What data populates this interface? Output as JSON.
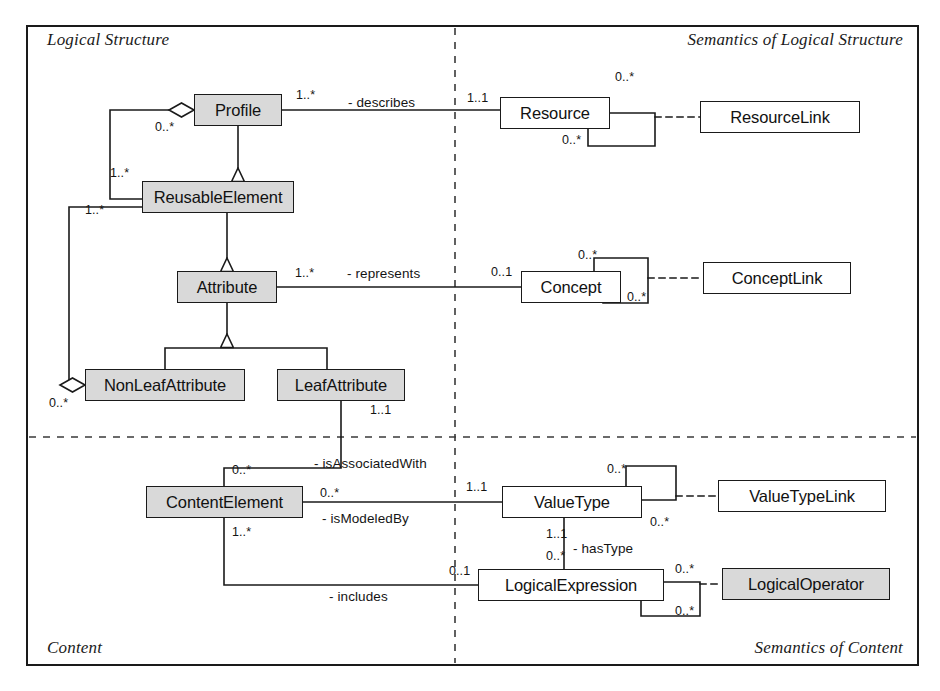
{
  "diagram": {
    "colors": {
      "shaded_fill": "#d9d9d9",
      "plain_fill": "#ffffff",
      "line": "#1a1a1a",
      "background": "#ffffff"
    },
    "quadrant_labels": [
      {
        "id": "logical-structure",
        "text": "Logical Structure",
        "x": 47,
        "y": 30,
        "align": "left"
      },
      {
        "id": "semantics-logical-structure",
        "text": "Semantics of Logical Structure",
        "x": 903,
        "y": 30,
        "align": "right"
      },
      {
        "id": "content",
        "text": "Content",
        "x": 47,
        "y": 638,
        "align": "left"
      },
      {
        "id": "semantics-of-content",
        "text": "Semantics of Content",
        "x": 903,
        "y": 638,
        "align": "right"
      }
    ],
    "classes": [
      {
        "id": "profile",
        "name": "Profile",
        "shaded": true,
        "x": 194,
        "y": 94,
        "w": 88,
        "h": 32
      },
      {
        "id": "reusable-element",
        "name": "ReusableElement",
        "shaded": true,
        "x": 142,
        "y": 181,
        "w": 152,
        "h": 32
      },
      {
        "id": "attribute",
        "name": "Attribute",
        "shaded": true,
        "x": 177,
        "y": 271,
        "w": 100,
        "h": 32
      },
      {
        "id": "non-leaf-attribute",
        "name": "NonLeafAttribute",
        "shaded": true,
        "x": 85,
        "y": 369,
        "w": 160,
        "h": 32
      },
      {
        "id": "leaf-attribute",
        "name": "LeafAttribute",
        "shaded": true,
        "x": 277,
        "y": 369,
        "w": 128,
        "h": 32
      },
      {
        "id": "content-element",
        "name": "ContentElement",
        "shaded": true,
        "x": 146,
        "y": 486,
        "w": 157,
        "h": 32
      },
      {
        "id": "resource",
        "name": "Resource",
        "shaded": false,
        "x": 500,
        "y": 97,
        "w": 110,
        "h": 32
      },
      {
        "id": "resource-link",
        "name": "ResourceLink",
        "shaded": false,
        "x": 700,
        "y": 101,
        "w": 160,
        "h": 32
      },
      {
        "id": "concept",
        "name": "Concept",
        "shaded": false,
        "x": 521,
        "y": 271,
        "w": 100,
        "h": 32
      },
      {
        "id": "concept-link",
        "name": "ConceptLink",
        "shaded": false,
        "x": 703,
        "y": 262,
        "w": 148,
        "h": 32
      },
      {
        "id": "value-type",
        "name": "ValueType",
        "shaded": false,
        "x": 502,
        "y": 486,
        "w": 140,
        "h": 32
      },
      {
        "id": "value-type-link",
        "name": "ValueTypeLink",
        "shaded": false,
        "x": 718,
        "y": 480,
        "w": 168,
        "h": 32
      },
      {
        "id": "logical-expression",
        "name": "LogicalExpression",
        "shaded": false,
        "x": 478,
        "y": 569,
        "w": 186,
        "h": 32
      },
      {
        "id": "logical-operator",
        "name": "LogicalOperator",
        "shaded": true,
        "x": 722,
        "y": 568,
        "w": 168,
        "h": 32
      }
    ],
    "multiplicities": [
      {
        "id": "profile-describes-source",
        "text": "1..*",
        "x": 296,
        "y": 88
      },
      {
        "id": "profile-aggregation-end",
        "text": "0..*",
        "x": 155,
        "y": 120
      },
      {
        "id": "profile-to-reusable-target",
        "text": "1..*",
        "x": 110,
        "y": 166
      },
      {
        "id": "nonleaf-aggregation-target",
        "text": "1..*",
        "x": 85,
        "y": 203
      },
      {
        "id": "attribute-represents-source",
        "text": "1..*",
        "x": 295,
        "y": 266
      },
      {
        "id": "nonleaf-aggregation-end",
        "text": "0..*",
        "x": 49,
        "y": 396
      },
      {
        "id": "leafattribute-assoc-source",
        "text": "1..1",
        "x": 370,
        "y": 403
      },
      {
        "id": "contentelement-associatedwith",
        "text": "0..*",
        "x": 232,
        "y": 463
      },
      {
        "id": "contentelement-modeledby",
        "text": "0..*",
        "x": 320,
        "y": 486
      },
      {
        "id": "contentelement-includes",
        "text": "1..*",
        "x": 232,
        "y": 525
      },
      {
        "id": "resource-describes-target",
        "text": "1..1",
        "x": 467,
        "y": 91
      },
      {
        "id": "resource-self-top",
        "text": "0..*",
        "x": 615,
        "y": 70
      },
      {
        "id": "resource-self-bottom",
        "text": "0..*",
        "x": 562,
        "y": 133
      },
      {
        "id": "concept-represents-target",
        "text": "0..1",
        "x": 491,
        "y": 265
      },
      {
        "id": "concept-self-top",
        "text": "0..*",
        "x": 578,
        "y": 248
      },
      {
        "id": "concept-self-bottom",
        "text": "0..*",
        "x": 627,
        "y": 290
      },
      {
        "id": "valuetype-modeledby-target",
        "text": "1..1",
        "x": 466,
        "y": 480
      },
      {
        "id": "valuetype-self-top",
        "text": "0..*",
        "x": 607,
        "y": 462
      },
      {
        "id": "valuetype-self-bottom",
        "text": "0..*",
        "x": 650,
        "y": 515
      },
      {
        "id": "valuetype-hastype-source",
        "text": "1..1",
        "x": 546,
        "y": 527
      },
      {
        "id": "logicalexpression-hastype-end",
        "text": "0..*",
        "x": 546,
        "y": 549
      },
      {
        "id": "logicalexpression-includes-end",
        "text": "0..1",
        "x": 449,
        "y": 564
      },
      {
        "id": "logicaloperator-self-top",
        "text": "0..*",
        "x": 675,
        "y": 562
      },
      {
        "id": "logicaloperator-self-bottom",
        "text": "0..*",
        "x": 675,
        "y": 604
      }
    ],
    "roles": [
      {
        "id": "role-describes",
        "text": "- describes",
        "x": 348,
        "y": 95
      },
      {
        "id": "role-represents",
        "text": "- represents",
        "x": 347,
        "y": 266
      },
      {
        "id": "role-isassociatedwith",
        "text": "- isAssociatedWith",
        "x": 314,
        "y": 456
      },
      {
        "id": "role-ismodeledby",
        "text": "- isModeledBy",
        "x": 322,
        "y": 511
      },
      {
        "id": "role-hastype",
        "text": "- hasType",
        "x": 573,
        "y": 541
      },
      {
        "id": "role-includes",
        "text": "- includes",
        "x": 329,
        "y": 589
      }
    ]
  }
}
